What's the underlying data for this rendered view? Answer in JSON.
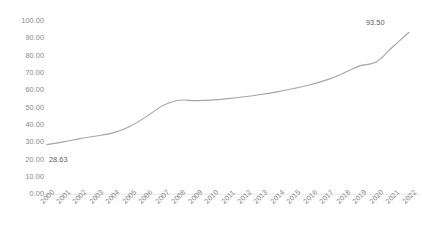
{
  "chart_data": {
    "type": "line",
    "title": "",
    "subtitle": "",
    "xlabel": "",
    "ylabel": "",
    "grid": false,
    "legend": false,
    "legend_position": "none",
    "line_color": "#a5a5a5",
    "axis_color": "#d9d9d9",
    "tick_label_color": "#868686",
    "data_label_color": "#595959",
    "xlim": [
      2000,
      2022
    ],
    "ylim": [
      0,
      100
    ],
    "ytick_step": 10,
    "ytick_labels": [
      "100.00",
      "90.00",
      "80.00",
      "70.00",
      "60.00",
      "50.00",
      "40.00",
      "30.00",
      "20.00",
      "10.00",
      "0.00"
    ],
    "ytick_values": [
      100,
      90,
      80,
      70,
      60,
      50,
      40,
      30,
      20,
      10,
      0
    ],
    "categories": [
      "2000",
      "2001",
      "2002",
      "2003",
      "2004",
      "2005",
      "2006",
      "2007",
      "2008",
      "2009",
      "2010",
      "2011",
      "2012",
      "2013",
      "2014",
      "2015",
      "2016",
      "2017",
      "2018",
      "2019",
      "2020",
      "2021",
      "2022"
    ],
    "values": [
      28.63,
      30.2,
      32.1,
      33.6,
      35.4,
      39.0,
      44.5,
      51.0,
      54.2,
      54.0,
      54.3,
      55.2,
      56.3,
      57.6,
      59.1,
      61.0,
      63.2,
      66.0,
      69.8,
      74.1,
      76.3,
      85.0,
      93.5
    ],
    "data_labels": [
      {
        "category": "2000",
        "value": 28.63,
        "text": "28.63"
      },
      {
        "category": "2022",
        "value": 93.5,
        "text": "93.50"
      }
    ]
  },
  "chart": {
    "first_label": "28.63",
    "last_label": "93.50"
  }
}
